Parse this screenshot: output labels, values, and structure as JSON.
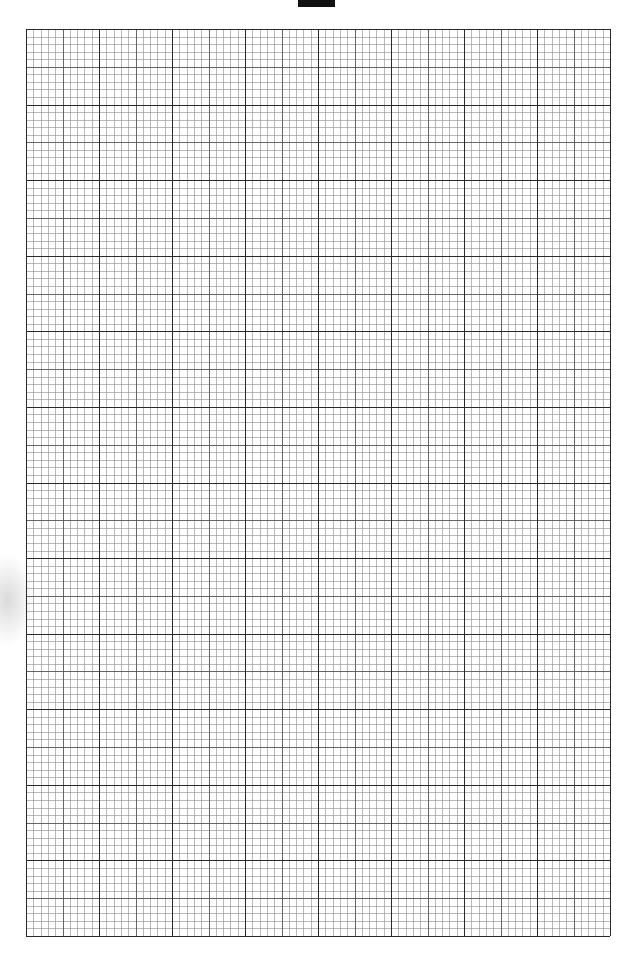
{
  "page": {
    "type": "graph paper",
    "header_label": "",
    "grid": {
      "major_columns": 8,
      "major_rows": 12,
      "minor_divisions_per_major": 10,
      "medium_line_every": 5,
      "colors": {
        "major": "#2a2a2a",
        "medium": "#555555",
        "minor": "#8a8a8a",
        "paper": "#ffffff"
      }
    }
  }
}
